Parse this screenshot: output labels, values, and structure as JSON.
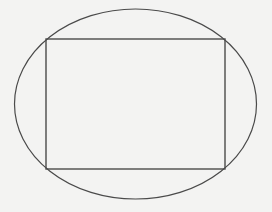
{
  "diagram": {
    "background": "#f3f3f2",
    "stroke_color": "#4a4a4a",
    "ellipse": {
      "cx": 135.5,
      "cy": 104,
      "rx": 121,
      "ry": 95,
      "stroke_width": 1.2
    },
    "rectangle": {
      "x": 46,
      "y": 39,
      "width": 179,
      "height": 130,
      "stroke_width": 1.4
    }
  }
}
